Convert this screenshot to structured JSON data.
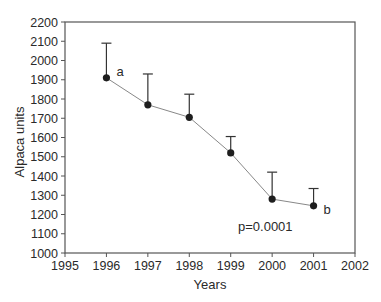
{
  "chart_data": {
    "type": "line",
    "title": "",
    "xlabel": "Years",
    "ylabel": "Alpaca units",
    "xlim": [
      1995,
      2002
    ],
    "ylim": [
      1000,
      2200
    ],
    "x_ticks": [
      1995,
      1996,
      1997,
      1998,
      1999,
      2000,
      2001,
      2002
    ],
    "y_ticks": [
      1000,
      1100,
      1200,
      1300,
      1400,
      1500,
      1600,
      1700,
      1800,
      1900,
      2000,
      2100,
      2200
    ],
    "grid": false,
    "legend": null,
    "series": [
      {
        "name": "Alpaca units",
        "x": [
          1996,
          1997,
          1998,
          1999,
          2000,
          2001
        ],
        "values": [
          1910,
          1770,
          1705,
          1520,
          1280,
          1245
        ],
        "error_upper": [
          2090,
          1930,
          1825,
          1605,
          1420,
          1335
        ]
      }
    ],
    "annotations": [
      {
        "text": "a",
        "x": 1996,
        "y": 1910
      },
      {
        "text": "b",
        "x": 2001,
        "y": 1245
      },
      {
        "text": "p=0.0001",
        "x": 1999.2,
        "y": 1280
      }
    ]
  }
}
